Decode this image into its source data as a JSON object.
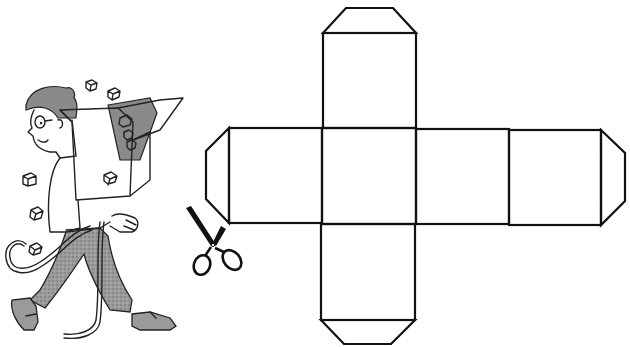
{
  "figure": {
    "caption": "Cube net with glue tabs"
  },
  "cube_net": {
    "faces": [
      {
        "id": "top",
        "x": 323,
        "y": 33,
        "w": 93,
        "h": 95
      },
      {
        "id": "left",
        "x": 229,
        "y": 128,
        "w": 94,
        "h": 95
      },
      {
        "id": "center",
        "x": 322,
        "y": 128,
        "w": 94,
        "h": 96
      },
      {
        "id": "right-middle",
        "x": 416,
        "y": 129,
        "w": 93,
        "h": 95
      },
      {
        "id": "far-right",
        "x": 509,
        "y": 130,
        "w": 92,
        "h": 95
      },
      {
        "id": "bottom",
        "x": 321,
        "y": 224,
        "w": 94,
        "h": 96
      }
    ],
    "tabs": [
      {
        "id": "top-tab",
        "points": "323,33 346,8 393,8 416,33"
      },
      {
        "id": "left-tab",
        "points": "229,128 206,151 206,199 229,223"
      },
      {
        "id": "right-tab",
        "points": "601,130 625,153 625,201 601,225"
      },
      {
        "id": "bottom-tab",
        "points": "321,320 344,344 391,344 415,320"
      }
    ],
    "stroke_color": "#111111"
  },
  "illustration": {
    "character": "man carrying open cardboard box",
    "tool": "scissors",
    "accent_gray": "#8a8a8a"
  }
}
